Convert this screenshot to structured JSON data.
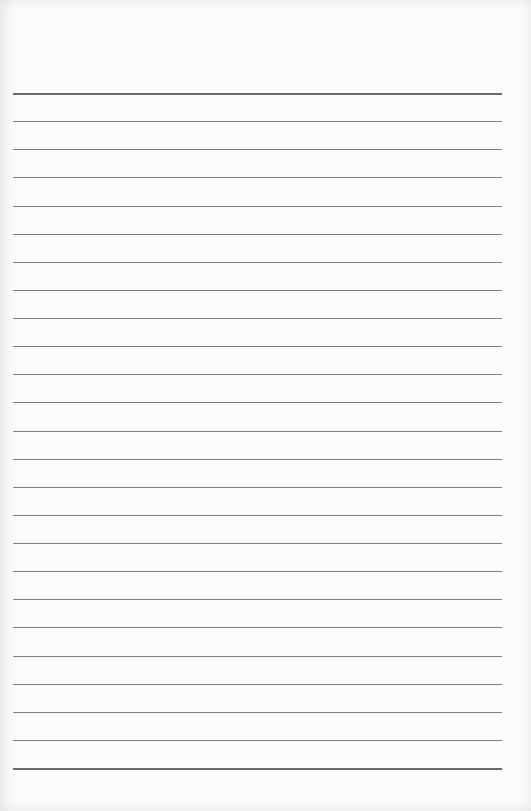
{
  "page": {
    "type": "lined-paper",
    "background_color": "#fbfbfb",
    "line_color": "#7d7d7d",
    "line_count": 25,
    "first_line_y": 93,
    "last_line_y": 768,
    "line_left_x": 13,
    "line_right_x": 502
  }
}
